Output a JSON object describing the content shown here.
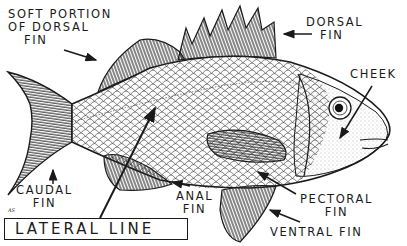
{
  "diagram": {
    "labels": {
      "soft_dorsal_line1": "SOFT PORTION",
      "soft_dorsal_line2": "OF DORSAL",
      "soft_dorsal_line3": "FIN",
      "dorsal_line1": "DORSAL",
      "dorsal_line2": "FIN",
      "cheek": "CHEEK",
      "caudal_line1": "CAUDAL",
      "caudal_line2": "FIN",
      "anal_line1": "ANAL",
      "anal_line2": "FIN",
      "pectoral_line1": "PECTORAL",
      "pectoral_line2": "FIN",
      "ventral": "VENTRAL  FIN",
      "lateral_line": "LATERAL LINE"
    },
    "signature": "AS",
    "colors": {
      "ink": "#1a1a1a",
      "paper": "#ffffff"
    }
  }
}
